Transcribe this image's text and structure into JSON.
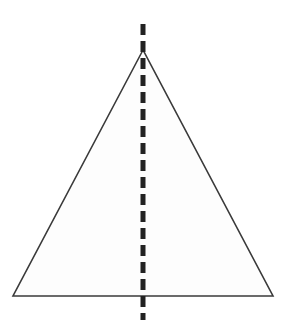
{
  "figure": {
    "name": "isosceles-triangle-with-vertical-line-of-symmetry",
    "title": "",
    "caption": "",
    "background_color": "#ffffff",
    "canvas": {
      "width": 286,
      "height": 336
    },
    "shapes": {
      "triangle": {
        "label": "triangle",
        "type": "isosceles-triangle",
        "points": "143,50 13,296 273,296",
        "vertices": [
          {
            "name": "apex",
            "x": 143,
            "y": 50
          },
          {
            "name": "bottom-left",
            "x": 13,
            "y": 296
          },
          {
            "name": "bottom-right",
            "x": 273,
            "y": 296
          }
        ],
        "fill_color": "#fdfdfd",
        "stroke_color": "#3a3a3a",
        "stroke_width": 1.6
      },
      "symmetry_line": {
        "label": "line of symmetry",
        "type": "dashed-vertical-line",
        "x": 143,
        "y_start": 24,
        "y_end": 320,
        "stroke_color": "#222222",
        "stroke_width": 5,
        "dash_length": 11,
        "gap_length": 6
      }
    }
  }
}
